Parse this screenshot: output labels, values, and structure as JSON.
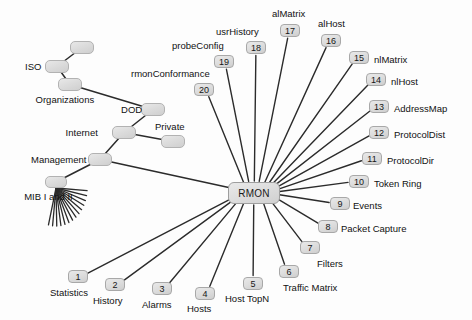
{
  "diagram": {
    "width": 472,
    "height": 320,
    "background": "#fdfdfd",
    "edge_color": "#2b2b2b",
    "node_fill": "#dcdcdc",
    "node_border": "#b2b2b2",
    "hub": {
      "label": "RMON",
      "x": 228,
      "y": 182,
      "w": 52,
      "h": 22
    },
    "tree_nodes": [
      {
        "name": "iso-parent-node",
        "label": "",
        "x": 70,
        "y": 41,
        "w": 24,
        "h": 13
      },
      {
        "name": "iso-node",
        "label": "ISO",
        "label_side": "left",
        "x": 45,
        "y": 60,
        "w": 24,
        "h": 13
      },
      {
        "name": "organizations-node",
        "label": "Organizations",
        "label_side": "below",
        "x": 58,
        "y": 78,
        "w": 24,
        "h": 13
      },
      {
        "name": "dod-node",
        "label": "DOD",
        "label_side": "left",
        "x": 141,
        "y": 103,
        "w": 24,
        "h": 13
      },
      {
        "name": "internet-node",
        "label": "Internet",
        "label_side": "left",
        "x": 112,
        "y": 126,
        "w": 24,
        "h": 13
      },
      {
        "name": "private-node",
        "label": "Private",
        "label_side": "above",
        "x": 161,
        "y": 135,
        "w": 24,
        "h": 13
      },
      {
        "name": "management-node",
        "label": "Management",
        "label_side": "left",
        "x": 88,
        "y": 153,
        "w": 24,
        "h": 13
      },
      {
        "name": "mib-node",
        "label": "MIB I and II",
        "label_side": "below",
        "x": 45,
        "y": 176,
        "w": 22,
        "h": 12
      }
    ],
    "tree_edges": [
      {
        "from": "iso-parent-node",
        "to": "iso-node"
      },
      {
        "from": "iso-node",
        "to": "organizations-node"
      },
      {
        "from": "organizations-node",
        "to": "dod-node"
      },
      {
        "from": "dod-node",
        "to": "internet-node"
      },
      {
        "from": "internet-node",
        "to": "private-node"
      },
      {
        "from": "internet-node",
        "to": "management-node"
      },
      {
        "from": "management-node",
        "to": "mib-node"
      },
      {
        "from": "management-node",
        "to": "hub"
      }
    ],
    "mib_fan": {
      "count": 14,
      "origin_x": 56,
      "origin_y": 188,
      "start_angle_deg": 176,
      "end_angle_deg": 76,
      "length": 38
    },
    "rmon_groups": [
      {
        "number": "1",
        "label": "Statistics",
        "badge_x": 68,
        "badge_y": 270,
        "label_x": 50,
        "label_y": 288,
        "label_align": "left"
      },
      {
        "number": "2",
        "label": "History",
        "badge_x": 105,
        "badge_y": 278,
        "label_x": 93,
        "label_y": 296,
        "label_align": "left"
      },
      {
        "number": "3",
        "label": "Alarms",
        "badge_x": 152,
        "badge_y": 282,
        "label_x": 142,
        "label_y": 300,
        "label_align": "left"
      },
      {
        "number": "4",
        "label": "Hosts",
        "badge_x": 195,
        "badge_y": 287,
        "label_x": 187,
        "label_y": 304,
        "label_align": "left"
      },
      {
        "number": "5",
        "label": "Host TopN",
        "badge_x": 243,
        "badge_y": 277,
        "label_x": 225,
        "label_y": 294,
        "label_align": "left"
      },
      {
        "number": "6",
        "label": "Traffic Matrix",
        "badge_x": 279,
        "badge_y": 265,
        "label_x": 283,
        "label_y": 283,
        "label_align": "left"
      },
      {
        "number": "7",
        "label": "Filters",
        "badge_x": 300,
        "badge_y": 241,
        "label_x": 317,
        "label_y": 259,
        "label_align": "left"
      },
      {
        "number": "8",
        "label": "Packet Capture",
        "badge_x": 318,
        "badge_y": 220,
        "label_x": 341,
        "label_y": 224,
        "label_align": "left"
      },
      {
        "number": "9",
        "label": "Events",
        "badge_x": 330,
        "badge_y": 197,
        "label_x": 353,
        "label_y": 201,
        "label_align": "left"
      },
      {
        "number": "10",
        "label": "Token Ring",
        "badge_x": 349,
        "badge_y": 175,
        "label_x": 374,
        "label_y": 179,
        "label_align": "left"
      },
      {
        "number": "11",
        "label": "ProtocolDir",
        "badge_x": 362,
        "badge_y": 152,
        "label_x": 387,
        "label_y": 156,
        "label_align": "left"
      },
      {
        "number": "12",
        "label": "ProtocolDist",
        "badge_x": 369,
        "badge_y": 126,
        "label_x": 394,
        "label_y": 130,
        "label_align": "left"
      },
      {
        "number": "13",
        "label": "AddressMap",
        "badge_x": 369,
        "badge_y": 100,
        "label_x": 394,
        "label_y": 104,
        "label_align": "left"
      },
      {
        "number": "14",
        "label": "nlHost",
        "badge_x": 366,
        "badge_y": 73,
        "label_x": 391,
        "label_y": 77,
        "label_align": "left"
      },
      {
        "number": "15",
        "label": "nlMatrix",
        "badge_x": 349,
        "badge_y": 51,
        "label_x": 374,
        "label_y": 55,
        "label_align": "left"
      },
      {
        "number": "16",
        "label": "alHost",
        "badge_x": 321,
        "badge_y": 34,
        "label_x": 318,
        "label_y": 19,
        "label_align": "left"
      },
      {
        "number": "17",
        "label": "alMatrix",
        "badge_x": 280,
        "badge_y": 24,
        "label_x": 272,
        "label_y": 9,
        "label_align": "left"
      },
      {
        "number": "18",
        "label": "usrHistory",
        "badge_x": 246,
        "badge_y": 41,
        "label_x": 216,
        "label_y": 27,
        "label_align": "left"
      },
      {
        "number": "19",
        "label": "probeConfig",
        "badge_x": 214,
        "badge_y": 55,
        "label_x": 172,
        "label_y": 41,
        "label_align": "left"
      },
      {
        "number": "20",
        "label": "rmonConformance",
        "badge_x": 194,
        "badge_y": 83,
        "label_x": 131,
        "label_y": 69,
        "label_align": "left"
      }
    ]
  }
}
